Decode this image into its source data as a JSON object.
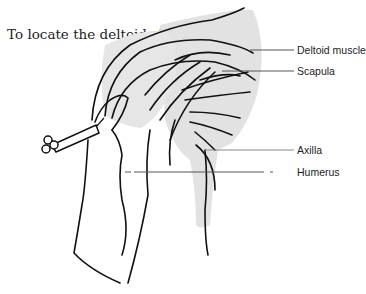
{
  "title": "To locate the deltoid site:",
  "labels": {
    "deltoid": "Deltoid muscle",
    "scapula": "Scapula",
    "axilla": "Axilla",
    "humerus": "Humerus"
  },
  "colors": {
    "shade": "#e2e2e2",
    "ink": "#111111",
    "leader": "#555555"
  }
}
